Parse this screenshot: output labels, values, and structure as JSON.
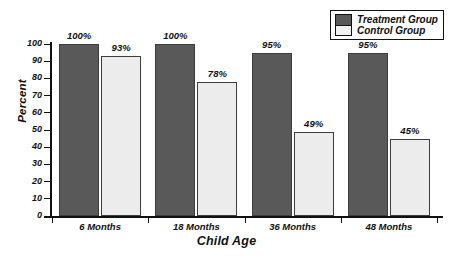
{
  "chart_data": {
    "type": "bar",
    "title": "",
    "xlabel": "Child Age",
    "ylabel": "Percent",
    "categories": [
      "6 Months",
      "18 Months",
      "36 Months",
      "48 Months"
    ],
    "series": [
      {
        "name": "Treatment Group",
        "color": "#595959",
        "values": [
          100,
          100,
          95,
          95
        ],
        "labels": [
          "100%",
          "100%",
          "95%",
          "95%"
        ]
      },
      {
        "name": "Control Group",
        "color": "#ececec",
        "values": [
          93,
          78,
          49,
          45
        ],
        "labels": [
          "93%",
          "78%",
          "49%",
          "45%"
        ]
      }
    ],
    "ylim": [
      0,
      100
    ],
    "yticks": [
      0,
      10,
      20,
      30,
      40,
      50,
      60,
      70,
      80,
      90,
      100
    ],
    "ytick_labels": [
      "0",
      "10",
      "20",
      "30",
      "40",
      "50",
      "60",
      "70",
      "80",
      "90",
      "100"
    ],
    "grid": false,
    "legend_position": "top-right",
    "legend_entries": [
      "Treatment Group",
      "Control Group"
    ]
  }
}
